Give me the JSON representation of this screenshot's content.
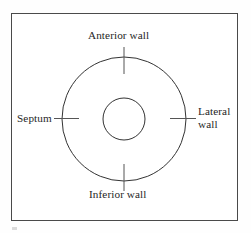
{
  "figure": {
    "background_color": "#ffffff",
    "frame": {
      "stroke_color": "#4a4a4a",
      "stroke_width": 1
    },
    "geometry": {
      "center_x": 124,
      "center_y": 119,
      "outer_circle_radius": 62,
      "inner_circle_radius": 21,
      "stroke_color": "#333333",
      "stroke_width": 1,
      "tick_color": "#555555",
      "tick_length": 26
    },
    "labels": {
      "anterior": "Anterior wall",
      "septum": "Septum",
      "lateral_line1": "Lateral",
      "lateral_line2": "wall",
      "inferior": "Inferior wall"
    },
    "text_color": "#262626"
  }
}
